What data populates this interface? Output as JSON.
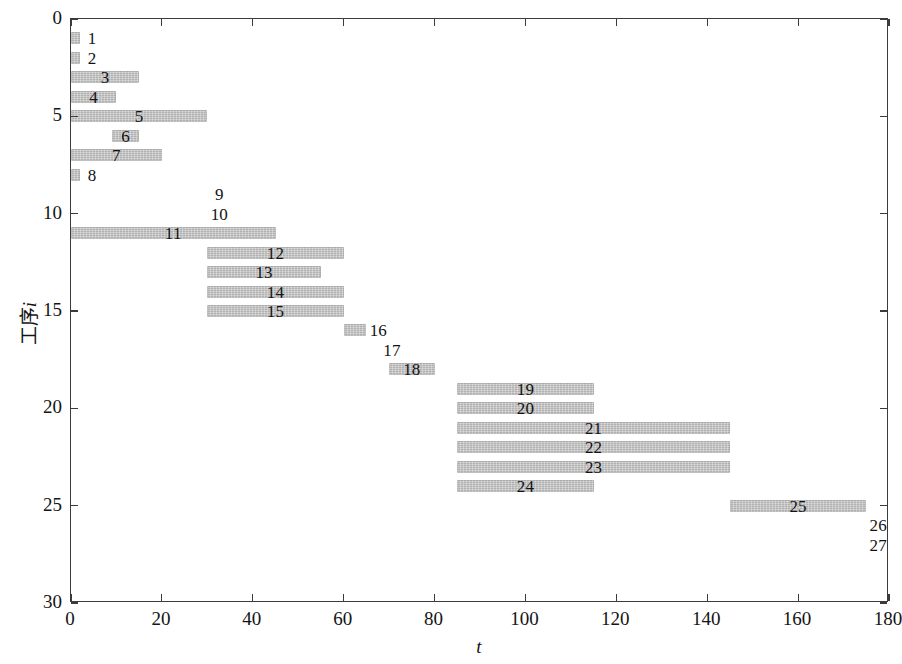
{
  "chart_data": {
    "type": "bar",
    "subtype": "gantt",
    "title": "",
    "xlabel": "t",
    "ylabel": "工序i",
    "xlim": [
      0,
      180
    ],
    "ylim": [
      0,
      30
    ],
    "y_inverted": true,
    "grid": false,
    "legend": null,
    "xticks": [
      0,
      20,
      40,
      60,
      80,
      100,
      120,
      140,
      160,
      180
    ],
    "xtick_labels": [
      "0",
      "20",
      "40",
      "60",
      "80",
      "100",
      "120",
      "140",
      "160",
      "180"
    ],
    "yticks": [
      0,
      5,
      10,
      15,
      20,
      25,
      30
    ],
    "ytick_labels": [
      "0",
      "5",
      "10",
      "15",
      "20",
      "25",
      "30"
    ],
    "bar_color": "#b9b9b9",
    "axis_color": "#3b3b3b",
    "bar_height_units": 0.62,
    "tasks": [
      {
        "id": 1,
        "label": "1",
        "row": 1,
        "start": 0,
        "end": 1,
        "duration": 1
      },
      {
        "id": 2,
        "label": "2",
        "row": 2,
        "start": 0,
        "end": 1,
        "duration": 1
      },
      {
        "id": 3,
        "label": "3",
        "row": 3,
        "start": 0,
        "end": 15,
        "duration": 15
      },
      {
        "id": 4,
        "label": "4",
        "row": 4,
        "start": 0,
        "end": 10,
        "duration": 10
      },
      {
        "id": 5,
        "label": "5",
        "row": 5,
        "start": 0,
        "end": 30,
        "duration": 30
      },
      {
        "id": 6,
        "label": "6",
        "row": 6,
        "start": 9,
        "end": 15,
        "duration": 6
      },
      {
        "id": 7,
        "label": "7",
        "row": 7,
        "start": 0,
        "end": 20,
        "duration": 20
      },
      {
        "id": 8,
        "label": "8",
        "row": 8,
        "start": 0,
        "end": 1,
        "duration": 1
      },
      {
        "id": 9,
        "label": "9",
        "row": 9,
        "start": 30,
        "end": 30,
        "duration": 0
      },
      {
        "id": 10,
        "label": "10",
        "row": 10,
        "start": 30,
        "end": 30,
        "duration": 0
      },
      {
        "id": 11,
        "label": "11",
        "row": 11,
        "start": 0,
        "end": 45,
        "duration": 45
      },
      {
        "id": 12,
        "label": "12",
        "row": 12,
        "start": 30,
        "end": 60,
        "duration": 30
      },
      {
        "id": 13,
        "label": "13",
        "row": 13,
        "start": 30,
        "end": 55,
        "duration": 25
      },
      {
        "id": 14,
        "label": "14",
        "row": 14,
        "start": 30,
        "end": 60,
        "duration": 30
      },
      {
        "id": 15,
        "label": "15",
        "row": 15,
        "start": 30,
        "end": 60,
        "duration": 30
      },
      {
        "id": 16,
        "label": "16",
        "row": 16,
        "start": 60,
        "end": 65,
        "duration": 5
      },
      {
        "id": 17,
        "label": "17",
        "row": 17,
        "start": 68,
        "end": 68,
        "duration": 0
      },
      {
        "id": 18,
        "label": "18",
        "row": 18,
        "start": 70,
        "end": 80,
        "duration": 10
      },
      {
        "id": 19,
        "label": "19",
        "row": 19,
        "start": 85,
        "end": 115,
        "duration": 30
      },
      {
        "id": 20,
        "label": "20",
        "row": 20,
        "start": 85,
        "end": 115,
        "duration": 30
      },
      {
        "id": 21,
        "label": "21",
        "row": 21,
        "start": 85,
        "end": 145,
        "duration": 60
      },
      {
        "id": 22,
        "label": "22",
        "row": 22,
        "start": 85,
        "end": 145,
        "duration": 60
      },
      {
        "id": 23,
        "label": "23",
        "row": 23,
        "start": 85,
        "end": 145,
        "duration": 60
      },
      {
        "id": 24,
        "label": "24",
        "row": 24,
        "start": 85,
        "end": 115,
        "duration": 30
      },
      {
        "id": 25,
        "label": "25",
        "row": 25,
        "start": 145,
        "end": 175,
        "duration": 30
      },
      {
        "id": 26,
        "label": "26",
        "row": 26,
        "start": 175,
        "end": 175,
        "duration": 0
      },
      {
        "id": 27,
        "label": "27",
        "row": 27,
        "start": 175,
        "end": 175,
        "duration": 0
      }
    ]
  }
}
